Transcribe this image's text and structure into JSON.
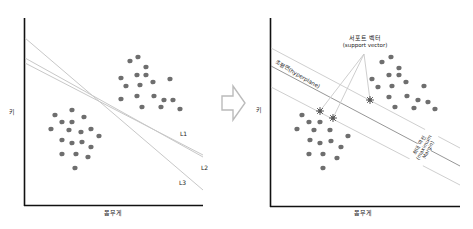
{
  "left_panel": {
    "y_axis_label": "키",
    "x_axis_label": "몸무게",
    "lines": [
      {
        "label": "L1",
        "x1": 25,
        "y1": 63,
        "x2": 203,
        "y2": 155
      },
      {
        "label": "L2",
        "x1": 25,
        "y1": 58,
        "x2": 203,
        "y2": 157
      },
      {
        "label": "L3",
        "x1": 25,
        "y1": 38,
        "x2": 203,
        "y2": 190
      }
    ],
    "line_label_positions": {
      "L1": [
        180,
        131
      ],
      "L2": [
        201,
        163
      ],
      "L3": [
        179,
        178
      ]
    },
    "cluster_a": [
      [
        130,
        61
      ],
      [
        138,
        57
      ],
      [
        146,
        67
      ],
      [
        121,
        78
      ],
      [
        137,
        75
      ],
      [
        146,
        75
      ],
      [
        126,
        86
      ],
      [
        140,
        85
      ],
      [
        153,
        82
      ],
      [
        170,
        79
      ],
      [
        121,
        99
      ],
      [
        137,
        96
      ],
      [
        154,
        96
      ],
      [
        164,
        100
      ],
      [
        173,
        100
      ],
      [
        142,
        107
      ],
      [
        161,
        107
      ],
      [
        180,
        109
      ]
    ],
    "cluster_b": [
      [
        55,
        115
      ],
      [
        72,
        110
      ],
      [
        62,
        122
      ],
      [
        72,
        122
      ],
      [
        84,
        117
      ],
      [
        51,
        129
      ],
      [
        69,
        130
      ],
      [
        81,
        132
      ],
      [
        91,
        129
      ],
      [
        99,
        136
      ],
      [
        62,
        140
      ],
      [
        72,
        143
      ],
      [
        82,
        142
      ],
      [
        91,
        147
      ],
      [
        62,
        154
      ],
      [
        76,
        154
      ],
      [
        88,
        157
      ],
      [
        75,
        168
      ]
    ]
  },
  "arrow": {
    "icon": "right-arrow-outline"
  },
  "right_panel": {
    "y_axis_label": "키",
    "x_axis_label": "몸무게",
    "support_vector_label": "서포트 벡터",
    "support_vector_label_en": "(support vector)",
    "hyperplane_label": "초평면(hyperplane)",
    "max_margin_label_ko": "최대 마진",
    "max_margin_label_en_1": "(maximum",
    "max_margin_label_en_2": "Margin)",
    "cluster_a": [
      [
        382,
        62
      ],
      [
        391,
        57
      ],
      [
        399,
        68
      ],
      [
        372,
        79
      ],
      [
        389,
        75
      ],
      [
        399,
        75
      ],
      [
        378,
        87
      ],
      [
        392,
        86
      ],
      [
        406,
        82
      ],
      [
        424,
        86
      ],
      [
        389,
        97
      ],
      [
        407,
        96
      ],
      [
        418,
        100
      ],
      [
        428,
        102
      ],
      [
        395,
        107
      ],
      [
        414,
        108
      ],
      [
        435,
        109
      ]
    ],
    "cluster_b": [
      [
        302,
        115
      ],
      [
        309,
        122
      ],
      [
        320,
        122
      ],
      [
        297,
        129
      ],
      [
        314,
        130
      ],
      [
        330,
        130
      ],
      [
        348,
        136
      ],
      [
        310,
        140
      ],
      [
        320,
        143
      ],
      [
        331,
        141
      ],
      [
        341,
        147
      ],
      [
        309,
        154
      ],
      [
        323,
        154
      ],
      [
        337,
        158
      ],
      [
        323,
        168
      ]
    ],
    "support_vectors": [
      [
        320,
        111
      ],
      [
        333,
        118
      ],
      [
        370,
        100
      ]
    ],
    "dot_color": "#6e6e6e",
    "line_color": "#c8c8c8"
  }
}
